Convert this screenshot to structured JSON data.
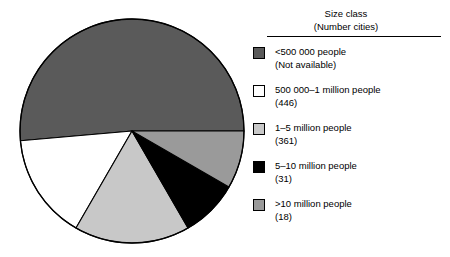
{
  "chart_data": {
    "type": "pie",
    "title": "",
    "subtitle": "",
    "xlabel": "",
    "ylabel": "",
    "legend_position": "right",
    "grid": false,
    "legend_header_line1": "Size class",
    "legend_header_line2": "(Number cities)",
    "start_angle_deg": 0,
    "direction": "counterclockwise",
    "categories": [
      "<500 000 people",
      "500 000–1 million people",
      "1–5 million people",
      "5–10 million people",
      ">10 million people"
    ],
    "counts": [
      null,
      446,
      361,
      31,
      18
    ],
    "count_labels": [
      "(Not available)",
      "(446)",
      "(361)",
      "(31)",
      "(18)"
    ],
    "values": [
      51.4,
      15.3,
      16.7,
      8.3,
      8.3
    ],
    "colors": [
      "#5a5a5a",
      "#ffffff",
      "#c8c8c8",
      "#000000",
      "#9a9a9a"
    ],
    "slice_angles_deg": [
      {
        "start": 0,
        "end": 185
      },
      {
        "start": 185,
        "end": 240
      },
      {
        "start": 240,
        "end": 300
      },
      {
        "start": 300,
        "end": 330
      },
      {
        "start": 330,
        "end": 360
      }
    ]
  },
  "legend": {
    "header": {
      "line1": "Size class",
      "line2": "(Number cities)"
    },
    "items": [
      {
        "label": "<500 000 people",
        "count": "(Not available)",
        "color": "#5a5a5a"
      },
      {
        "label": "500 000–1 million people",
        "count": "(446)",
        "color": "#ffffff"
      },
      {
        "label": "1–5 million people",
        "count": "(361)",
        "color": "#c8c8c8"
      },
      {
        "label": "5–10 million people",
        "count": "(31)",
        "color": "#000000"
      },
      {
        "label": ">10 million people",
        "count": "(18)",
        "color": "#9a9a9a"
      }
    ]
  }
}
